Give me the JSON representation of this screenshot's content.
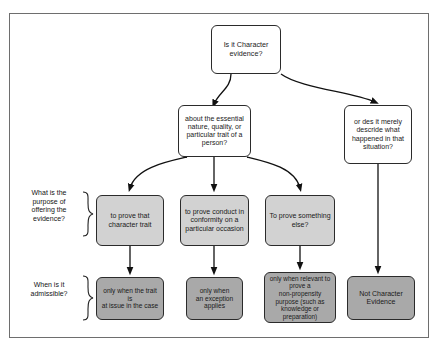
{
  "diagram": {
    "title_text": "",
    "colors": {
      "border": "#6e6e6e",
      "node_border": "#2b2b2b",
      "node_white": "#ffffff",
      "node_gray": "#d2d2d2",
      "node_dark_gray": "#a9a9a9",
      "arrow": "#111111",
      "text": "#1a1a1a"
    },
    "nodes": {
      "root": "Is it Character\nevidence?",
      "branch_left": "about the essential\nnature, quality, or\nparticular trait of a\nperson?",
      "branch_right": "or des it merely\ndescride what\nhappened in that\nsituation?",
      "purpose_1": "to prove that\ncharacter trait",
      "purpose_2": "to prove conduct in\nconformity on a\nparticular occasion",
      "purpose_3": "To prove something\nelse?",
      "admissible_1": "only when the trait is\nat issue in the case",
      "admissible_2": "only when\nan exception\napplies",
      "admissible_3": "only when relevant to\nprove a\nnon-propensity\npurpose (such as\nknowledge or\npreparation)",
      "not_character": "Not Character\nEvidence"
    },
    "side_labels": {
      "purpose_question": "What is the\npurpose of\noffering the\nevidence?",
      "admissible_question": "When is it\nadmissible?"
    }
  }
}
